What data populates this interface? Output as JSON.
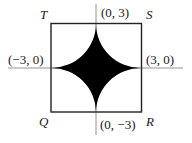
{
  "diagram": {
    "type": "geometry-figure",
    "vertices": {
      "T": "T",
      "S": "S",
      "Q": "Q",
      "R": "R"
    },
    "points": {
      "top": "(0, 3)",
      "right": "(3, 0)",
      "left": "(−3, 0)",
      "bottom": "(0, −3)"
    },
    "colors": {
      "fill": "#000000",
      "stroke": "#222222",
      "axis": "#777777"
    }
  }
}
